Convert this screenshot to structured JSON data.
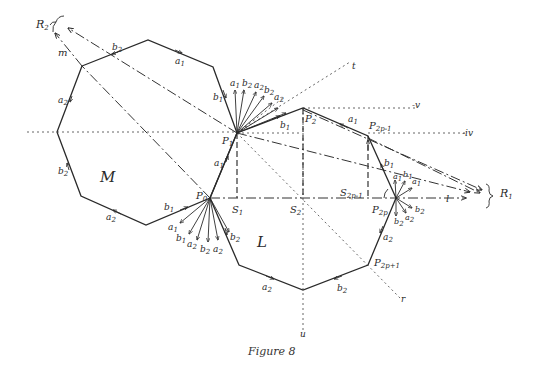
{
  "figure": {
    "caption": "Figure 8",
    "regions": {
      "M": "M",
      "L": "L"
    },
    "points": {
      "P0": "P",
      "P0_sub": "0",
      "P1": "P",
      "P1_sub": "1",
      "P2": "P",
      "P2_sub": "2",
      "P2p_1": "P",
      "P2p_1_sub": "2p-1",
      "P2p": "P",
      "P2p_sub": "2p",
      "P2p1": "P",
      "P2p1_sub": "2p+1",
      "S1": "S",
      "S1_sub": "1",
      "S2": "S",
      "S2_sub": "2",
      "S2p_1": "S",
      "S2p_1_sub": "2p-1"
    },
    "rays": {
      "R1": "R",
      "R1_sub": "1",
      "R2": "R",
      "R2_sub": "2",
      "m": "m",
      "l": "l",
      "t": "t",
      "r": "r",
      "u": "u",
      "v": "-v",
      "iv": "-iv"
    },
    "edge_labels": {
      "a1": "a",
      "a1_sub": "1",
      "a2": "a",
      "a2_sub": "2",
      "b1": "b",
      "b1_sub": "1",
      "b2": "b",
      "b2_sub": "2"
    },
    "fan_P1": [
      "a1",
      "b2",
      "a2",
      "b2",
      "a2"
    ],
    "fan_P0": [
      "a1",
      "b1",
      "a2",
      "b2",
      "a2"
    ],
    "fan_P2p": [
      "a1",
      "b1",
      "a1",
      "b2",
      "a2",
      "b2"
    ]
  }
}
